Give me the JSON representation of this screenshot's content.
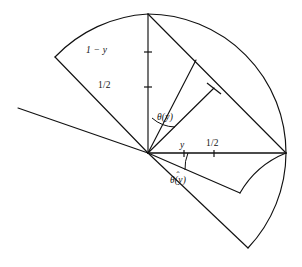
{
  "figure": {
    "background_color": "#ffffff",
    "stroke_color": "#111111",
    "width": 302,
    "height": 267
  },
  "labels": {
    "one_minus_y": "1 − y",
    "half_vertical": "1/2",
    "y_horizontal": "y",
    "half_horizontal": "1/2",
    "theta": "θ(y)",
    "theta_hat_base": "θ(y)",
    "theta_hat_mark": "ˆ"
  },
  "geometry": {
    "vertex": {
      "x": 148,
      "y": 153
    },
    "radius_outer": 139,
    "ticks": {
      "vertical": [
        {
          "label_key": "one_minus_y",
          "y": 52
        },
        {
          "label_key": "half_vertical",
          "y": 87
        }
      ],
      "horizontal": [
        {
          "label_key": "y_horizontal",
          "x": 184
        },
        {
          "label_key": "half_horizontal",
          "x": 214
        }
      ]
    },
    "rays": [
      {
        "name": "vertical-up",
        "to": {
          "x": 148,
          "y": 14
        }
      },
      {
        "name": "horizontal-right",
        "to": {
          "x": 286,
          "y": 153
        }
      },
      {
        "name": "upper-left-sector-edge",
        "to": {
          "x": 55,
          "y": 57
        }
      },
      {
        "name": "far-left-ray",
        "to": {
          "x": 18,
          "y": 108
        }
      },
      {
        "name": "theta-ray-short",
        "to": {
          "x": 196,
          "y": 60
        }
      },
      {
        "name": "theta-ray-mid",
        "to": {
          "x": 214,
          "y": 88
        }
      },
      {
        "name": "diagonal-long",
        "to": {
          "x": 286,
          "y": 153
        }
      },
      {
        "name": "lower-ray-upper",
        "to": {
          "x": 240,
          "y": 193
        }
      },
      {
        "name": "lower-ray-lower",
        "to": {
          "x": 248,
          "y": 248
        }
      }
    ],
    "arcs": [
      {
        "name": "outer-arc-upper-left",
        "from": {
          "x": 55,
          "y": 57
        },
        "to": {
          "x": 148,
          "y": 14
        }
      },
      {
        "name": "outer-arc-upper-right",
        "from": {
          "x": 148,
          "y": 14
        },
        "to": {
          "x": 286,
          "y": 153
        }
      },
      {
        "name": "outer-arc-lower",
        "from": {
          "x": 286,
          "y": 153
        },
        "to": {
          "x": 248,
          "y": 248
        }
      },
      {
        "name": "inner-arc-lower",
        "from": {
          "x": 286,
          "y": 153
        },
        "to": {
          "x": 240,
          "y": 193
        }
      }
    ],
    "angle_arcs": [
      {
        "name": "theta-angle-arc"
      },
      {
        "name": "theta-hat-angle-arc"
      }
    ]
  }
}
